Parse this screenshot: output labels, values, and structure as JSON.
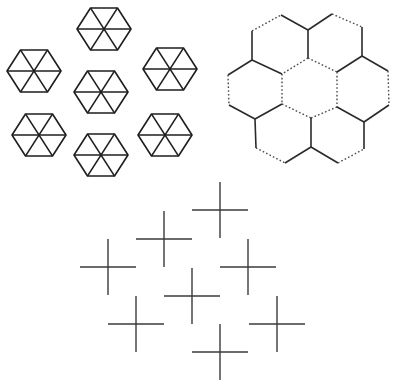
{
  "canvas": {
    "width": 399,
    "height": 391,
    "background": "#ffffff",
    "ink": "#1e1e1e"
  },
  "figures": {
    "hexagon_cluster": {
      "description": "Seven flat-top hexagons each divided into six triangles",
      "radius_x": 27,
      "half_height": 21,
      "centers": [
        [
          104,
          29
        ],
        [
          34,
          71
        ],
        [
          170,
          69
        ],
        [
          101,
          92
        ],
        [
          39,
          135
        ],
        [
          101,
          155
        ],
        [
          165,
          135
        ]
      ]
    },
    "honeycomb": {
      "description": "Seven-cell honeycomb with mixed solid and dotted edges",
      "edges": [
        {
          "a": [
            252,
            31
          ],
          "b": [
            281,
            15
          ],
          "style": "dotted"
        },
        {
          "a": [
            281,
            15
          ],
          "b": [
            308,
            30
          ],
          "style": "solid"
        },
        {
          "a": [
            308,
            30
          ],
          "b": [
            332,
            14
          ],
          "style": "solid"
        },
        {
          "a": [
            332,
            14
          ],
          "b": [
            362,
            27
          ],
          "style": "dotted"
        },
        {
          "a": [
            252,
            31
          ],
          "b": [
            252,
            60
          ],
          "style": "solid"
        },
        {
          "a": [
            308,
            30
          ],
          "b": [
            308,
            58
          ],
          "style": "solid"
        },
        {
          "a": [
            362,
            27
          ],
          "b": [
            362,
            56
          ],
          "style": "solid"
        },
        {
          "a": [
            252,
            60
          ],
          "b": [
            228,
            75
          ],
          "style": "solid"
        },
        {
          "a": [
            252,
            60
          ],
          "b": [
            282,
            74
          ],
          "style": "solid"
        },
        {
          "a": [
            308,
            58
          ],
          "b": [
            282,
            74
          ],
          "style": "dotted"
        },
        {
          "a": [
            308,
            58
          ],
          "b": [
            337,
            72
          ],
          "style": "dotted"
        },
        {
          "a": [
            362,
            56
          ],
          "b": [
            337,
            72
          ],
          "style": "solid"
        },
        {
          "a": [
            362,
            56
          ],
          "b": [
            388,
            71
          ],
          "style": "solid"
        },
        {
          "a": [
            228,
            75
          ],
          "b": [
            229,
            105
          ],
          "style": "dotted"
        },
        {
          "a": [
            282,
            74
          ],
          "b": [
            282,
            104
          ],
          "style": "dotted"
        },
        {
          "a": [
            337,
            72
          ],
          "b": [
            337,
            107
          ],
          "style": "dotted"
        },
        {
          "a": [
            388,
            71
          ],
          "b": [
            389,
            105
          ],
          "style": "dotted"
        },
        {
          "a": [
            229,
            105
          ],
          "b": [
            255,
            119
          ],
          "style": "solid"
        },
        {
          "a": [
            282,
            104
          ],
          "b": [
            255,
            119
          ],
          "style": "solid"
        },
        {
          "a": [
            282,
            104
          ],
          "b": [
            311,
            118
          ],
          "style": "dotted"
        },
        {
          "a": [
            337,
            107
          ],
          "b": [
            311,
            118
          ],
          "style": "dotted"
        },
        {
          "a": [
            337,
            107
          ],
          "b": [
            364,
            122
          ],
          "style": "solid"
        },
        {
          "a": [
            389,
            105
          ],
          "b": [
            364,
            122
          ],
          "style": "solid"
        },
        {
          "a": [
            255,
            119
          ],
          "b": [
            256,
            148
          ],
          "style": "solid"
        },
        {
          "a": [
            311,
            118
          ],
          "b": [
            311,
            147
          ],
          "style": "solid"
        },
        {
          "a": [
            364,
            122
          ],
          "b": [
            364,
            149
          ],
          "style": "solid"
        },
        {
          "a": [
            256,
            148
          ],
          "b": [
            285,
            163
          ],
          "style": "dotted"
        },
        {
          "a": [
            285,
            163
          ],
          "b": [
            311,
            147
          ],
          "style": "solid"
        },
        {
          "a": [
            311,
            147
          ],
          "b": [
            338,
            163
          ],
          "style": "solid"
        },
        {
          "a": [
            338,
            163
          ],
          "b": [
            364,
            149
          ],
          "style": "dotted"
        }
      ]
    },
    "cross_cluster": {
      "description": "Eight plus-sign crosses arranged in a diamond lattice",
      "arm": 28,
      "centers": [
        [
          220,
          210
        ],
        [
          164,
          239
        ],
        [
          108,
          267
        ],
        [
          248,
          267
        ],
        [
          192,
          296
        ],
        [
          136,
          324
        ],
        [
          277,
          324
        ],
        [
          220,
          352
        ]
      ]
    }
  }
}
